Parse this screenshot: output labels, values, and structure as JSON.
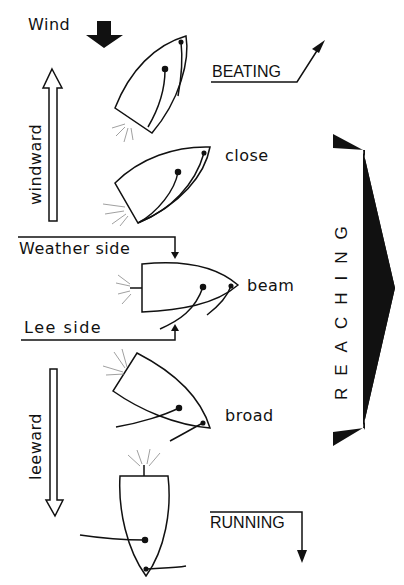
{
  "wind": {
    "label": "Wind",
    "icon": "down-arrow-icon"
  },
  "directions": {
    "windward": "windward",
    "leeward": "leeward"
  },
  "sides": {
    "weather": "Weather side",
    "lee": "Lee side"
  },
  "points_of_sail": [
    {
      "id": "beating",
      "label": "BEATING"
    },
    {
      "id": "close",
      "label": "close"
    },
    {
      "id": "beam",
      "label": "beam"
    },
    {
      "id": "broad",
      "label": "broad"
    },
    {
      "id": "running",
      "label": "RUNNING"
    }
  ],
  "reaching": {
    "label": "REACHING"
  },
  "colors": {
    "ink": "#111111",
    "background": "#ffffff",
    "wake": "#888888"
  }
}
